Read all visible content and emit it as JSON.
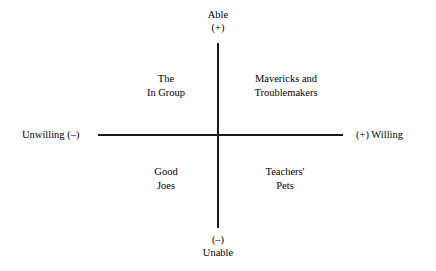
{
  "chart_data": {
    "type": "scatter",
    "title": "",
    "subtitle": "",
    "xlabel": "",
    "ylabel": "",
    "grid": false,
    "legend_position": "none",
    "axes": {
      "vertical": {
        "positive_label": "Able",
        "positive_sign": "(+)",
        "negative_sign": "(–)",
        "negative_label": "Unable"
      },
      "horizontal": {
        "negative_label": "Unwilling (–)",
        "positive_label": "(+) Willing"
      }
    },
    "quadrants": [
      {
        "position": "upper-left",
        "x_axis": "unwilling",
        "y_axis": "able",
        "lines": [
          "The",
          "In Group"
        ]
      },
      {
        "position": "upper-right",
        "x_axis": "willing",
        "y_axis": "able",
        "lines": [
          "Mavericks and",
          "Troublemakers"
        ]
      },
      {
        "position": "lower-left",
        "x_axis": "unwilling",
        "y_axis": "unable",
        "lines": [
          "Good",
          "Joes"
        ]
      },
      {
        "position": "lower-right",
        "x_axis": "willing",
        "y_axis": "unable",
        "lines": [
          "Teachers'",
          "Pets"
        ]
      }
    ]
  },
  "diagram": {
    "background_color": "#ffffff",
    "line_color": "#1a1a1a",
    "text_color": "#000000",
    "axis_top": {
      "label": "Able",
      "sign": "(+)"
    },
    "axis_bottom": {
      "sign": "(–)",
      "label": "Unable"
    },
    "axis_left": {
      "label": "Unwilling (–)"
    },
    "axis_right": {
      "label": "(+) Willing"
    },
    "quadrant_upper_left": {
      "line1": "The",
      "line2": "In Group"
    },
    "quadrant_upper_right": {
      "line1": "Mavericks and",
      "line2": "Troublemakers"
    },
    "quadrant_lower_left": {
      "line1": "Good",
      "line2": "Joes"
    },
    "quadrant_lower_right": {
      "line1": "Teachers'",
      "line2": "Pets"
    }
  }
}
